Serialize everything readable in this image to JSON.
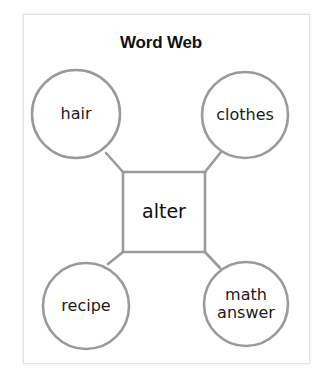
{
  "title": "Word Web",
  "center_word": "alter",
  "related": [
    {
      "position": "top-left",
      "lines": [
        "hair"
      ]
    },
    {
      "position": "top-right",
      "lines": [
        "clothes"
      ]
    },
    {
      "position": "bottom-left",
      "lines": [
        "recipe"
      ]
    },
    {
      "position": "bottom-right",
      "lines": [
        "math",
        "answer"
      ]
    }
  ],
  "colors": {
    "stroke": "#9a9a9a",
    "text": "#1a1a1a",
    "background": "#ffffff"
  }
}
